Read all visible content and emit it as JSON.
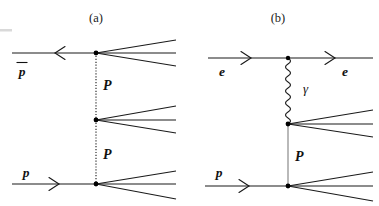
{
  "figure": {
    "width": 379,
    "height": 206,
    "background_color": "#ffffff",
    "line_color": "#1a1a1a",
    "pomeron_color": "#2b2b2b",
    "pomeron_b_color": "#8a8a8a"
  },
  "panels": [
    {
      "id": "panel-a",
      "caption": "(a)",
      "caption_x": 96,
      "caption_y": 22,
      "process": "proton-antiproton double pomeron exchange",
      "incoming": [
        {
          "name": "antiproton",
          "label": "p",
          "has_overline": true,
          "label_x": 22,
          "label_y": 76,
          "direction": "leftward",
          "line_y": 53,
          "line_x1": 12,
          "line_x2": 96,
          "arrow_x": 58
        },
        {
          "name": "proton",
          "label": "p",
          "has_overline": false,
          "label_x": 26,
          "label_y": 177,
          "direction": "rightward",
          "line_y": 184,
          "line_x1": 12,
          "line_x2": 96,
          "arrow_x": 56
        }
      ],
      "exchange_lines": [
        {
          "name": "pomeron-upper",
          "label": "P",
          "label_x": 103,
          "label_y": 90,
          "style": "dotted",
          "x": 96,
          "y1": 53,
          "y2": 120
        },
        {
          "name": "pomeron-lower",
          "label": "P",
          "label_x": 103,
          "label_y": 159,
          "style": "dotted",
          "x": 96,
          "y1": 120,
          "y2": 184
        }
      ],
      "vertices": [
        {
          "name": "vertex-top",
          "x": 96,
          "y": 53,
          "radius": 2.4
        },
        {
          "name": "vertex-middle",
          "x": 96,
          "y": 120,
          "radius": 2.4
        },
        {
          "name": "vertex-bottom",
          "x": 96,
          "y": 184,
          "radius": 2.4
        }
      ],
      "jets": [
        {
          "name": "jet-top",
          "origin_x": 96,
          "origin_y": 53,
          "end_x": 175,
          "end_ys": [
            41,
            53,
            65
          ]
        },
        {
          "name": "jet-middle",
          "origin_x": 96,
          "origin_y": 120,
          "end_x": 175,
          "end_ys": [
            106,
            120,
            133
          ]
        },
        {
          "name": "jet-bottom",
          "origin_x": 96,
          "origin_y": 184,
          "end_x": 175,
          "end_ys": [
            172,
            184,
            198
          ]
        }
      ]
    },
    {
      "id": "panel-b",
      "caption": "(b)",
      "caption_x": 278,
      "caption_y": 22,
      "process": "electron-proton photon-pomeron exchange",
      "incoming": [
        {
          "name": "electron-in",
          "label": "e",
          "has_overline": false,
          "label_x": 222,
          "label_y": 76,
          "direction": "rightward",
          "line_y": 58,
          "line_x1": 208,
          "line_x2": 288,
          "arrow_x": 248
        },
        {
          "name": "proton",
          "label": "p",
          "has_overline": false,
          "label_x": 219,
          "label_y": 177,
          "direction": "rightward",
          "line_y": 186,
          "line_x1": 205,
          "line_x2": 288,
          "arrow_x": 246
        }
      ],
      "outgoing": [
        {
          "name": "electron-out",
          "label": "e",
          "has_overline": false,
          "label_x": 345,
          "label_y": 76,
          "direction": "rightward",
          "line_y": 58,
          "line_x1": 288,
          "line_x2": 372,
          "arrow_x": 332
        }
      ],
      "exchange_lines": [
        {
          "name": "photon",
          "label": "γ",
          "label_x": 303,
          "label_y": 93,
          "style": "wavy",
          "x": 288,
          "y1": 58,
          "y2": 124,
          "amplitude": 4.2,
          "wavelength": 9.5
        },
        {
          "name": "pomeron",
          "label": "P",
          "label_x": 295,
          "label_y": 161,
          "style": "solid-light",
          "x": 288,
          "y1": 124,
          "y2": 186
        }
      ],
      "vertices": [
        {
          "name": "vertex-electron",
          "x": 288,
          "y": 58,
          "radius": 2.2
        },
        {
          "name": "vertex-photon-pomeron",
          "x": 288,
          "y": 124,
          "radius": 2.4
        },
        {
          "name": "vertex-proton",
          "x": 288,
          "y": 186,
          "radius": 2.4
        }
      ],
      "jets": [
        {
          "name": "jet-upper",
          "origin_x": 288,
          "origin_y": 124,
          "end_x": 372,
          "end_ys": [
            110,
            124,
            137
          ]
        },
        {
          "name": "jet-lower",
          "origin_x": 288,
          "origin_y": 186,
          "end_x": 372,
          "end_ys": [
            173,
            186,
            200
          ]
        }
      ]
    }
  ],
  "artifacts": [
    {
      "name": "scan-speck-top-left",
      "x": 0,
      "y": 29,
      "width": 12,
      "height": 3
    }
  ]
}
